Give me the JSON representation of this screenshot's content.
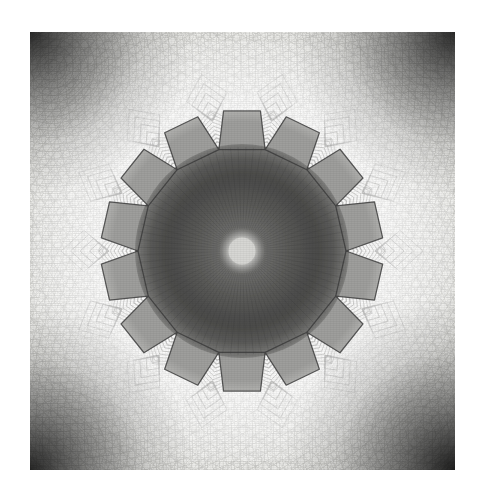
{
  "artwork": {
    "title": "Grayscale Kaleidoscopic Star Rosette Mandala",
    "medium": "digital fractal / kaleidoscope render",
    "palette_description": "monochrome grayscale",
    "caption": ""
  },
  "canvas": {
    "width": 483,
    "height": 499,
    "background_color": "#ffffff",
    "margin_left": 30,
    "margin_top": 32,
    "plate_width": 425,
    "plate_height": 438
  },
  "colors": {
    "page_background": "#ffffff",
    "plate_base": "#f4f4f2",
    "paper_light": "#fbfbfa",
    "vignette_corner": "#1a1a1a",
    "vignette_mid": "#707070",
    "inner_disc_dark": "#4f4f4f",
    "inner_disc_mid": "#6e6e6e",
    "petal_bright": "#fdfdfc",
    "petal_shadow": "#b9b9b7",
    "outline_stroke": "#3b3b3b",
    "contour_line": "#8e8e8c",
    "core_highlight": "#d9d9d6"
  },
  "composition": {
    "center_x": 212,
    "center_y": 219,
    "star_points": 14,
    "outer_radius": 142,
    "petal_tip_radius": 142,
    "petal_base_radius": 104,
    "inner_disc_radius": 106,
    "core_radius": 15,
    "rotation_deg": 0,
    "symmetry": "14-fold dihedral"
  },
  "elements": {
    "plate_name": "image-plate",
    "rosette_name": "star-rosette",
    "core_name": "central-core-highlight",
    "disc_name": "inner-dark-disc",
    "vignette_name": "corner-vignette",
    "texture_name": "background-swirl-texture",
    "grain_name": "film-grain-overlay"
  },
  "chart_data": {
    "type": "scatter",
    "title": "Grayscale Kaleidoscopic Star Rosette Mandala",
    "xlabel": "",
    "ylabel": "",
    "radial_profile_note": "mean luminance (0=black,255=white) sampled from center outward along plate radius",
    "radius_px": [
      0,
      15,
      35,
      55,
      75,
      95,
      106,
      120,
      142,
      165,
      190,
      215,
      240
    ],
    "luminance": [
      205,
      112,
      92,
      84,
      88,
      96,
      120,
      236,
      246,
      243,
      238,
      214,
      58
    ],
    "petal_angles_deg": [
      0,
      25.7,
      51.4,
      77.1,
      102.9,
      128.6,
      154.3,
      180,
      205.7,
      231.4,
      257.1,
      282.9,
      308.6,
      334.3
    ],
    "grid": false,
    "legend": "none"
  }
}
